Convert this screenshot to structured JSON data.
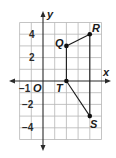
{
  "diagram": {
    "type": "coordinate-plane",
    "axes": {
      "x_label": "x",
      "y_label": "y",
      "origin_label": "O",
      "x_range": [
        -2,
        5
      ],
      "y_range": [
        -5,
        5
      ]
    },
    "tick_labels": {
      "y_4": "4",
      "y_2": "2",
      "y_neg2": "−2",
      "y_neg4": "−4",
      "x_neg1": "−1"
    },
    "points": [
      {
        "name": "Q",
        "x": 2,
        "y": 3
      },
      {
        "name": "R",
        "x": 4,
        "y": 4
      },
      {
        "name": "T",
        "x": 2,
        "y": 0
      },
      {
        "name": "S",
        "x": 4,
        "y": -3
      }
    ],
    "segments": [
      [
        "Q",
        "R"
      ],
      [
        "Q",
        "T"
      ],
      [
        "T",
        "S"
      ],
      [
        "R",
        "S"
      ]
    ],
    "colors": {
      "grid": "#b5b5b5",
      "lines": "#1a1a1a"
    }
  }
}
